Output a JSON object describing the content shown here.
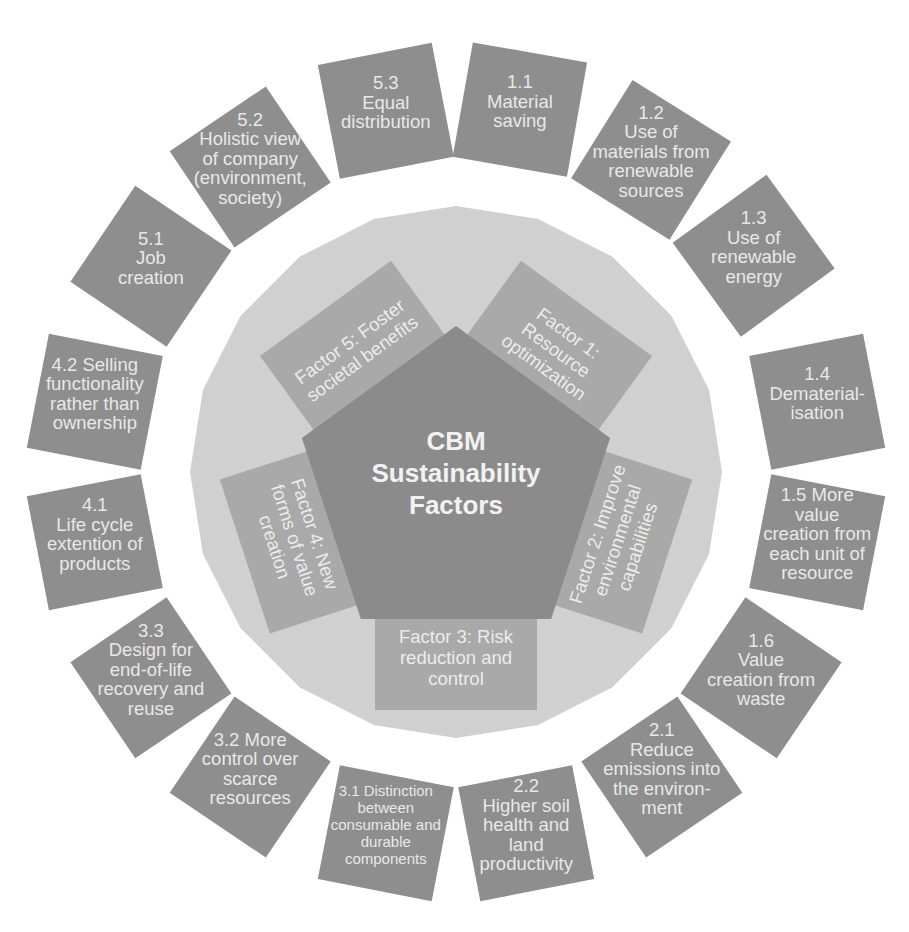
{
  "diagram": {
    "title_lines": [
      "CBM",
      "Sustainability",
      "Factors"
    ],
    "colors": {
      "background": "#ffffff",
      "outer_ring_polygon": "#d0d0d0",
      "factor_box": "#a9a9a9",
      "center_pentagon": "#8b8b8b",
      "outer_box": "#8e8e8e",
      "text": "#eeeeee"
    },
    "factors": [
      {
        "id": "factor-1",
        "lines": [
          "Factor 1:",
          "Resource",
          "optimization"
        ]
      },
      {
        "id": "factor-2",
        "lines": [
          "Factor 2: Improve",
          "environmental",
          "capabilities"
        ]
      },
      {
        "id": "factor-3",
        "lines": [
          "Factor 3: Risk",
          "reduction and",
          "control"
        ]
      },
      {
        "id": "factor-4",
        "lines": [
          "Factor 4: New",
          "forms of value",
          "creation"
        ]
      },
      {
        "id": "factor-5",
        "lines": [
          "Factor 5: Foster",
          "societal benefits"
        ]
      }
    ],
    "outer_items": [
      {
        "id": "1.1",
        "lines": [
          "1.1",
          "Material",
          "saving"
        ]
      },
      {
        "id": "1.2",
        "lines": [
          "1.2",
          "Use of",
          "materials from",
          "renewable",
          "sources"
        ]
      },
      {
        "id": "1.3",
        "lines": [
          "1.3",
          "Use of",
          "renewable",
          "energy"
        ]
      },
      {
        "id": "1.4",
        "lines": [
          "1.4",
          "Dematerial-",
          "isation"
        ]
      },
      {
        "id": "1.5",
        "lines": [
          "1.5 More",
          "value",
          "creation from",
          "each unit of",
          "resource"
        ]
      },
      {
        "id": "1.6",
        "lines": [
          "1.6",
          "Value",
          "creation from",
          "waste"
        ]
      },
      {
        "id": "2.1",
        "lines": [
          "2.1",
          "Reduce",
          "emissions into",
          "the environ-",
          "ment"
        ]
      },
      {
        "id": "2.2",
        "lines": [
          "2.2",
          "Higher soil",
          "health and",
          "land",
          "productivity"
        ]
      },
      {
        "id": "3.1",
        "lines": [
          "3.1 Distinction",
          "between",
          "consumable and",
          "durable",
          "components"
        ],
        "small": true
      },
      {
        "id": "3.2",
        "lines": [
          "3.2 More",
          "control over",
          "scarce",
          "resources"
        ]
      },
      {
        "id": "3.3",
        "lines": [
          "3.3",
          "Design for",
          "end-of-life",
          "recovery and",
          "reuse"
        ]
      },
      {
        "id": "4.1",
        "lines": [
          "4.1",
          "Life cycle",
          "extention of",
          "products"
        ]
      },
      {
        "id": "4.2",
        "lines": [
          "4.2 Selling",
          "functionality",
          "rather than",
          "ownership"
        ]
      },
      {
        "id": "5.1",
        "lines": [
          "5.1",
          "Job",
          "creation"
        ]
      },
      {
        "id": "5.2",
        "lines": [
          "5.2",
          "Holistic view",
          "of company",
          "(environment,",
          "society)"
        ]
      },
      {
        "id": "5.3",
        "lines": [
          "5.3",
          "Equal",
          "distribution"
        ]
      }
    ]
  }
}
